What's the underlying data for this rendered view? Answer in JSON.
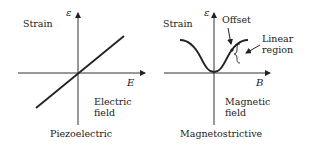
{
  "panels": [
    {
      "title": "Piezoelectric",
      "y_label": "Strain",
      "y_symbol": "ε",
      "x_symbol": "E",
      "x_label_line1": "Electric",
      "x_label_line2": "field",
      "curve": "linear"
    },
    {
      "title": "Magnetostrictive",
      "y_label": "Strain",
      "y_symbol": "ε",
      "x_symbol": "B",
      "x_label_line1": "Magnetic",
      "x_label_line2": "field",
      "curve": "quadratic-saturating",
      "annotations": {
        "offset": "Offset",
        "linear_line1": "Linear",
        "linear_line2": "region"
      }
    }
  ]
}
